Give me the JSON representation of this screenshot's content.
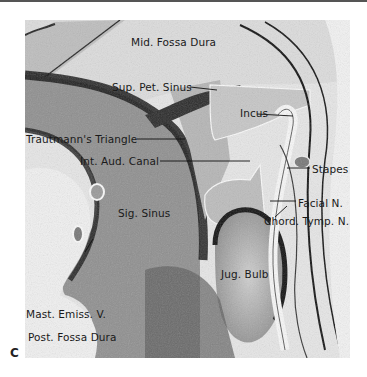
{
  "figure": {
    "panel_letter": "C",
    "labels": {
      "mid_fossa_dura": "Mid. Fossa Dura",
      "sup_pet_sinus": "Sup. Pet. Sinus",
      "incus": "Incus",
      "trautmanns_triangle": "Trautmann's Triangle",
      "int_aud_canal": "Int. Aud. Canal",
      "stapes": "Stapes",
      "sig_sinus": "Sig. Sinus",
      "facial_n": "Facial N.",
      "chord_tymp_n": "Chord. Tymp. N.",
      "jug_bulb": "Jug. Bulb",
      "mast_emiss_v": "Mast. Emiss. V.",
      "post_fossa_dura": "Post. Fossa Dura"
    }
  }
}
